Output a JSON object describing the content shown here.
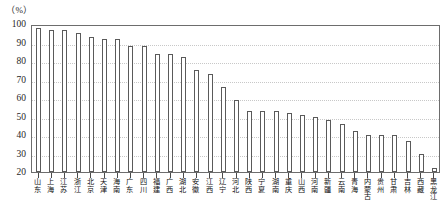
{
  "axis": {
    "unit_label": "（%）",
    "y_ticks": [
      100,
      90,
      80,
      70,
      60,
      50,
      40,
      30,
      20
    ]
  },
  "chart_data": {
    "type": "bar",
    "title": "",
    "subtitle": "",
    "xlabel": "",
    "ylabel": "（%）",
    "ylim": [
      20,
      100
    ],
    "grid": true,
    "legend": "none",
    "bar_style": {
      "fill": "#ffffff",
      "edge": "#5a5a5a"
    },
    "categories": [
      "山东",
      "上海",
      "江苏",
      "浙江",
      "北京",
      "天津",
      "海南",
      "广东",
      "四川",
      "福建",
      "广西",
      "湖北",
      "安徽",
      "江西",
      "辽宁",
      "河北",
      "陕西",
      "宁夏",
      "湖南",
      "重庆",
      "山西",
      "河南",
      "新疆",
      "云南",
      "青海",
      "内蒙古",
      "贵州",
      "甘肃",
      "吉林",
      "西藏",
      "黑龙江"
    ],
    "values": [
      98,
      97,
      97,
      95,
      93,
      92,
      92,
      88,
      88,
      84,
      84,
      82,
      75,
      73,
      66,
      59,
      53,
      53,
      53,
      52,
      51,
      50,
      48,
      46,
      42,
      40,
      40,
      40,
      37,
      30,
      22
    ]
  }
}
